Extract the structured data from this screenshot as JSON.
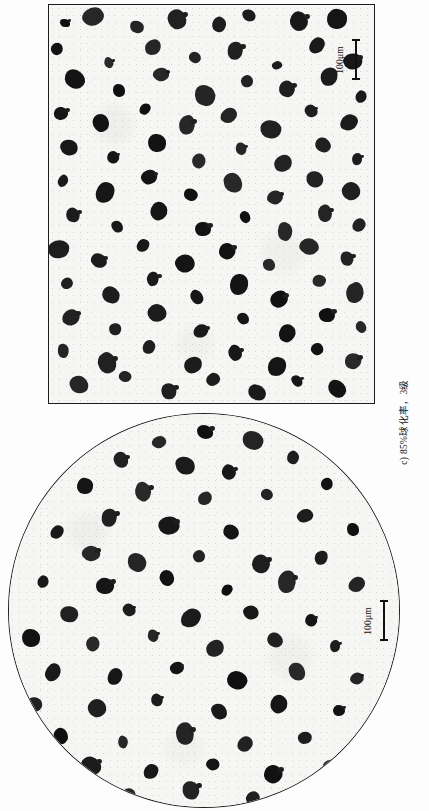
{
  "page": {
    "orientation": "rotated-90",
    "background_color": "#fdfdfd",
    "ink_color": "#1c1c1c"
  },
  "figure": {
    "caption": "c) 85%球化率，3级",
    "caption_translation_note": "c) 85% nodularity, grade 3",
    "panels": [
      {
        "id": "panel-top",
        "shape": "rectangle",
        "label": "rectangular-micrograph",
        "scale_bar": {
          "length_label": "100μm",
          "orientation": "vertical"
        },
        "subject": "nodular cast iron graphite micrograph"
      },
      {
        "id": "panel-bottom",
        "shape": "circle",
        "label": "circular-micrograph",
        "scale_bar": {
          "length_label": "100μm",
          "orientation": "vertical"
        },
        "subject": "nodular cast iron graphite micrograph"
      }
    ]
  },
  "scale_bars": {
    "top": "100μm",
    "bottom": "100μm"
  },
  "chart_data": {
    "type": "scatter",
    "title": "c) 85%球化率，3级",
    "xlabel": "",
    "ylabel": "",
    "note": "Metallographic micrograph: dark graphite nodules dispersed in light metal matrix",
    "series": [
      {
        "name": "graphite-nodules-rectangular-panel",
        "points": [
          [
            16,
            18,
            5
          ],
          [
            44,
            12,
            9
          ],
          [
            88,
            22,
            6
          ],
          [
            128,
            14,
            9
          ],
          [
            170,
            20,
            7
          ],
          [
            200,
            10,
            6
          ],
          [
            250,
            16,
            9
          ],
          [
            288,
            14,
            10
          ],
          [
            8,
            44,
            6
          ],
          [
            60,
            58,
            5
          ],
          [
            104,
            42,
            8
          ],
          [
            146,
            52,
            6
          ],
          [
            186,
            46,
            9
          ],
          [
            228,
            60,
            5
          ],
          [
            268,
            40,
            7
          ],
          [
            304,
            56,
            8
          ],
          [
            26,
            74,
            9
          ],
          [
            70,
            86,
            6
          ],
          [
            112,
            70,
            7
          ],
          [
            156,
            90,
            10
          ],
          [
            198,
            76,
            6
          ],
          [
            238,
            84,
            8
          ],
          [
            280,
            72,
            9
          ],
          [
            312,
            92,
            6
          ],
          [
            12,
            108,
            7
          ],
          [
            52,
            118,
            9
          ],
          [
            96,
            104,
            6
          ],
          [
            138,
            120,
            8
          ],
          [
            180,
            110,
            7
          ],
          [
            222,
            124,
            9
          ],
          [
            262,
            106,
            6
          ],
          [
            300,
            118,
            8
          ],
          [
            20,
            142,
            8
          ],
          [
            64,
            152,
            6
          ],
          [
            108,
            138,
            9
          ],
          [
            150,
            156,
            7
          ],
          [
            192,
            144,
            6
          ],
          [
            234,
            158,
            9
          ],
          [
            274,
            140,
            8
          ],
          [
            308,
            154,
            6
          ],
          [
            14,
            176,
            6
          ],
          [
            56,
            188,
            9
          ],
          [
            100,
            172,
            7
          ],
          [
            142,
            190,
            6
          ],
          [
            184,
            178,
            9
          ],
          [
            226,
            192,
            7
          ],
          [
            266,
            174,
            8
          ],
          [
            302,
            186,
            9
          ],
          [
            24,
            210,
            7
          ],
          [
            68,
            222,
            6
          ],
          [
            110,
            206,
            9
          ],
          [
            154,
            224,
            8
          ],
          [
            196,
            212,
            6
          ],
          [
            236,
            226,
            9
          ],
          [
            276,
            208,
            7
          ],
          [
            310,
            220,
            6
          ],
          [
            10,
            244,
            9
          ],
          [
            50,
            256,
            7
          ],
          [
            94,
            240,
            6
          ],
          [
            136,
            258,
            9
          ],
          [
            178,
            246,
            8
          ],
          [
            220,
            260,
            6
          ],
          [
            260,
            242,
            9
          ],
          [
            298,
            254,
            7
          ],
          [
            18,
            278,
            6
          ],
          [
            62,
            290,
            9
          ],
          [
            104,
            274,
            7
          ],
          [
            148,
            292,
            6
          ],
          [
            190,
            280,
            9
          ],
          [
            230,
            294,
            8
          ],
          [
            270,
            276,
            6
          ],
          [
            306,
            288,
            9
          ],
          [
            22,
            312,
            8
          ],
          [
            66,
            324,
            6
          ],
          [
            108,
            308,
            9
          ],
          [
            152,
            326,
            7
          ],
          [
            194,
            314,
            6
          ],
          [
            238,
            328,
            9
          ],
          [
            278,
            310,
            8
          ],
          [
            312,
            322,
            6
          ],
          [
            14,
            346,
            7
          ],
          [
            58,
            358,
            9
          ],
          [
            100,
            342,
            6
          ],
          [
            144,
            360,
            8
          ],
          [
            186,
            348,
            7
          ],
          [
            228,
            362,
            9
          ],
          [
            268,
            344,
            6
          ],
          [
            304,
            356,
            8
          ],
          [
            30,
            380,
            9
          ],
          [
            76,
            372,
            6
          ],
          [
            120,
            386,
            8
          ],
          [
            164,
            374,
            7
          ],
          [
            208,
            388,
            9
          ],
          [
            248,
            376,
            6
          ],
          [
            288,
            384,
            8
          ]
        ]
      },
      {
        "name": "graphite-nodules-circular-panel",
        "points": [
          [
            196,
            18,
            8
          ],
          [
            150,
            28,
            6
          ],
          [
            244,
            26,
            9
          ],
          [
            112,
            46,
            7
          ],
          [
            284,
            44,
            6
          ],
          [
            176,
            52,
            9
          ],
          [
            220,
            58,
            7
          ],
          [
            76,
            72,
            8
          ],
          [
            318,
            70,
            6
          ],
          [
            134,
            78,
            9
          ],
          [
            196,
            84,
            7
          ],
          [
            258,
            80,
            6
          ],
          [
            100,
            104,
            9
          ],
          [
            296,
            102,
            8
          ],
          [
            48,
            118,
            6
          ],
          [
            160,
            112,
            9
          ],
          [
            222,
            118,
            7
          ],
          [
            344,
            116,
            6
          ],
          [
            82,
            140,
            8
          ],
          [
            128,
            148,
            9
          ],
          [
            190,
            142,
            6
          ],
          [
            252,
            150,
            9
          ],
          [
            312,
            144,
            7
          ],
          [
            34,
            168,
            6
          ],
          [
            96,
            172,
            9
          ],
          [
            158,
            164,
            8
          ],
          [
            218,
            176,
            6
          ],
          [
            278,
            168,
            9
          ],
          [
            348,
            170,
            7
          ],
          [
            60,
            200,
            8
          ],
          [
            120,
            196,
            6
          ],
          [
            182,
            204,
            9
          ],
          [
            242,
            198,
            7
          ],
          [
            302,
            206,
            6
          ],
          [
            22,
            224,
            9
          ],
          [
            84,
            230,
            7
          ],
          [
            144,
            222,
            6
          ],
          [
            206,
            234,
            9
          ],
          [
            266,
            226,
            8
          ],
          [
            326,
            232,
            6
          ],
          [
            44,
            258,
            9
          ],
          [
            106,
            262,
            7
          ],
          [
            168,
            254,
            6
          ],
          [
            228,
            266,
            9
          ],
          [
            288,
            258,
            8
          ],
          [
            348,
            264,
            6
          ],
          [
            26,
            290,
            7
          ],
          [
            88,
            294,
            9
          ],
          [
            148,
            286,
            6
          ],
          [
            210,
            298,
            8
          ],
          [
            270,
            290,
            9
          ],
          [
            330,
            296,
            6
          ],
          [
            52,
            322,
            8
          ],
          [
            114,
            328,
            6
          ],
          [
            176,
            320,
            9
          ],
          [
            236,
            330,
            7
          ],
          [
            296,
            324,
            6
          ],
          [
            82,
            352,
            9
          ],
          [
            142,
            358,
            7
          ],
          [
            204,
            350,
            6
          ],
          [
            264,
            360,
            9
          ],
          [
            322,
            354,
            8
          ],
          [
            120,
            380,
            6
          ],
          [
            182,
            376,
            9
          ],
          [
            244,
            384,
            7
          ],
          [
            300,
            378,
            6
          ]
        ]
      }
    ]
  }
}
